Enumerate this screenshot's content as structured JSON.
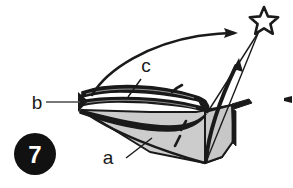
{
  "figure": {
    "number_badge": "7",
    "badge_bg_color": "#111111",
    "badge_text_color": "#ffffff",
    "background_color": "#ffffff",
    "ink_color": "#1a1a1a",
    "body_fill_color": "#cccccc",
    "labels": [
      {
        "id": "label-a",
        "text": "a",
        "x": 113,
        "y": 163
      },
      {
        "id": "label-b",
        "text": "b",
        "x": 32,
        "y": 108
      },
      {
        "id": "label-c",
        "text": "c",
        "x": 142,
        "y": 73
      }
    ],
    "star": {
      "name": "star-marker",
      "fill": "#ffffff",
      "stroke": "#1a1a1a",
      "center_x": 264,
      "center_y": 20,
      "radius": 13
    },
    "arrows": [
      {
        "id": "sweep-arrow",
        "description": "long curved sweeping arrow from left band up to the right"
      },
      {
        "id": "thick-arrow",
        "description": "thick curved arrow rising from body toward upper right"
      },
      {
        "id": "thin-pointer",
        "description": "thin straight line from body apex to star"
      }
    ],
    "bands": {
      "count": 3,
      "description": "three stacked dark curved bands forming layered wing structure"
    },
    "dashes": {
      "count": 2,
      "description": "two short dashed strokes inside the shaded body"
    },
    "tick_mark": {
      "id": "right-edge-tick",
      "x": 286,
      "y": 100
    }
  }
}
